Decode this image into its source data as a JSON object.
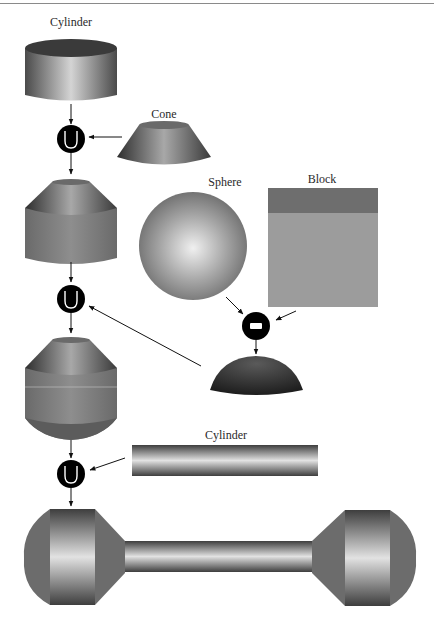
{
  "figure": {
    "colors": {
      "background": "#ffffff",
      "shape_dark": "#3c3c3c",
      "shape_mid": "#7a7a7a",
      "shape_light": "#d8d8d8",
      "block_top": "#6e6e6e",
      "block_face": "#9a9a9a",
      "operator_fill": "#000000",
      "operator_symbol": "#ffffff",
      "arrow": "#111111"
    }
  },
  "primitives": {
    "cylinder_top": {
      "label": "Cylinder"
    },
    "cone": {
      "label": "Cone"
    },
    "sphere": {
      "label": "Sphere"
    },
    "block": {
      "label": "Block"
    },
    "cylinder_bar": {
      "label": "Cylinder"
    }
  },
  "operators": [
    {
      "id": "union-1",
      "type": "union",
      "symbol": "∪"
    },
    {
      "id": "union-2",
      "type": "union",
      "symbol": "∪"
    },
    {
      "id": "difference-1",
      "type": "difference",
      "symbol": "−"
    },
    {
      "id": "union-3",
      "type": "union",
      "symbol": "∪"
    }
  ],
  "results": [
    {
      "id": "cylinder-plus-cone",
      "description": "Cylinder with conical top"
    },
    {
      "id": "hemisphere",
      "description": "Sphere minus Block (dome cap)"
    },
    {
      "id": "capped-body",
      "description": "Cylinder with cone top and dome bottom"
    },
    {
      "id": "final-dumbbell",
      "description": "Final part: two capped bodies joined by a cylinder bar"
    }
  ]
}
